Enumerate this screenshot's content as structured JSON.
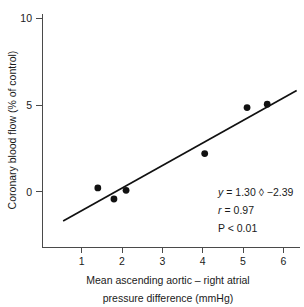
{
  "chart_data": {
    "type": "scatter",
    "title": "",
    "xlabel": "Mean ascending aortic – right atrial pressure difference (mmHg)",
    "xlabel_line1": "Mean ascending aortic – right atrial",
    "xlabel_line2": "pressure difference (mmHg)",
    "ylabel": "Coronary blood flow (% of control)",
    "xlim": [
      0.48,
      6.4
    ],
    "ylim": [
      -3.4,
      10.6
    ],
    "xticks": [
      1,
      2,
      3,
      4,
      5,
      6
    ],
    "xtick_labels": [
      "1",
      "2",
      "3",
      "4",
      "5",
      "6"
    ],
    "yticks": [
      0,
      5,
      10
    ],
    "ytick_labels": [
      "0",
      "5",
      "10"
    ],
    "grid": false,
    "legend": null,
    "marker_color": "#111111",
    "line_color": "#111111",
    "axis_color": "#4a4a4a",
    "x": [
      1.4,
      1.8,
      2.1,
      4.05,
      5.1,
      5.6
    ],
    "y": [
      0.22,
      -0.42,
      0.08,
      2.2,
      4.85,
      5.05
    ],
    "points": [
      {
        "x": 1.4,
        "y": 0.22
      },
      {
        "x": 1.8,
        "y": -0.42
      },
      {
        "x": 2.1,
        "y": 0.08
      },
      {
        "x": 4.05,
        "y": 2.2
      },
      {
        "x": 5.1,
        "y": 4.85
      },
      {
        "x": 5.6,
        "y": 5.05
      }
    ],
    "fit": {
      "slope": 1.3,
      "intercept": -2.39,
      "x_start": 0.54,
      "x_end": 6.33
    },
    "annotations": {
      "equation_var": "y",
      "equation_rest": "= 1.30 ◊ −2.39",
      "equation": "y = 1.30 ◊ −2.39",
      "correlation_var": "r",
      "correlation_rest": "= 0.97",
      "correlation": "r = 0.97",
      "pvalue": "P < 0.01"
    }
  }
}
